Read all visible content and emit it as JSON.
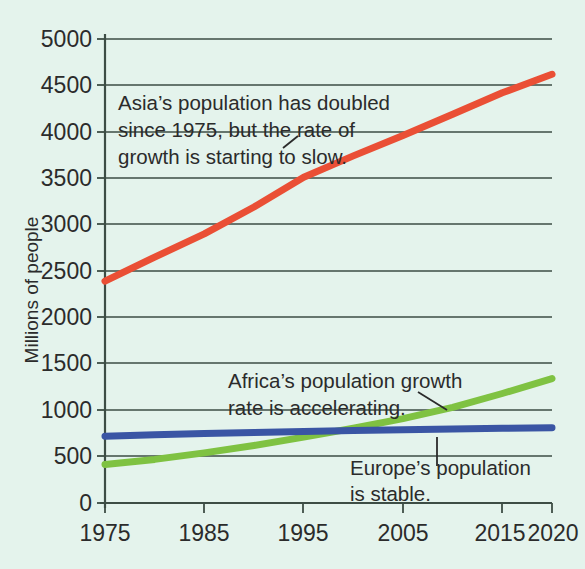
{
  "chart_data": {
    "type": "line",
    "title": "",
    "xlabel": "",
    "ylabel": "Millions of people",
    "xlim": [
      1975,
      2020
    ],
    "ylim": [
      0,
      5000
    ],
    "x_ticks": [
      1975,
      1985,
      1995,
      2005,
      2015,
      2020
    ],
    "y_ticks": [
      0,
      500,
      1000,
      1500,
      2000,
      2500,
      3000,
      3500,
      4000,
      4500,
      5000
    ],
    "grid": "horizontal",
    "legend": "none",
    "background_color": "#e4f3ec",
    "x": [
      1975,
      1980,
      1985,
      1990,
      1995,
      2000,
      2005,
      2010,
      2015,
      2020
    ],
    "series": [
      {
        "name": "Asia",
        "color": "#ea4f35",
        "values": [
          2390,
          2650,
          2900,
          3190,
          3510,
          3740,
          3960,
          4190,
          4420,
          4620
        ]
      },
      {
        "name": "Africa",
        "color": "#7fc242",
        "values": [
          415,
          470,
          540,
          620,
          710,
          805,
          910,
          1030,
          1180,
          1340
        ]
      },
      {
        "name": "Europe",
        "color": "#3a55a4",
        "values": [
          720,
          735,
          748,
          760,
          770,
          780,
          790,
          798,
          805,
          810
        ]
      }
    ],
    "annotations": [
      {
        "id": "asia",
        "lines": [
          "Asia’s population has doubled",
          "since 1975, but the rate of",
          "growth is starting to slow."
        ],
        "leader": "diagonal-up-right"
      },
      {
        "id": "africa",
        "lines": [
          "Africa’s population growth",
          "rate is accelerating."
        ],
        "leader": "diagonal-down-right"
      },
      {
        "id": "europe",
        "lines": [
          "Europe’s population",
          "is stable."
        ],
        "leader": "vertical-up"
      }
    ]
  },
  "axis": {
    "y_title": "Millions of people",
    "y_tick_labels": [
      "5000",
      "4500",
      "4000",
      "3500",
      "3000",
      "2500",
      "2000",
      "1500",
      "1000",
      "500",
      "0"
    ],
    "x_tick_labels": [
      "1975",
      "1985",
      "1995",
      "2005",
      "2015",
      "2020"
    ]
  },
  "annotations": {
    "asia": {
      "line1": "Asia’s population has doubled",
      "line2": "since 1975, but the rate of",
      "line3": "growth is starting to slow."
    },
    "africa": {
      "line1": "Africa’s population growth",
      "line2": "rate is accelerating."
    },
    "europe": {
      "line1": "Europe’s population",
      "line2": "is stable."
    }
  },
  "colors": {
    "asia_line": "#ea4f35",
    "africa_line": "#7fc242",
    "europe_line": "#3a55a4",
    "background": "#e4f3ec",
    "axis": "#3a4a42",
    "text": "#2b2b2b"
  }
}
